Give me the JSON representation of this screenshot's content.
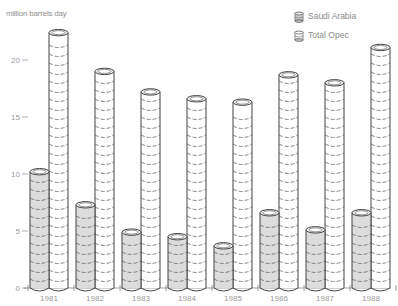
{
  "chart_data": {
    "type": "bar",
    "title": "",
    "ylabel": "million barrels day",
    "xlabel": "",
    "categories": [
      "1981",
      "1982",
      "1983",
      "1984",
      "1985",
      "1986",
      "1987",
      "1988"
    ],
    "series": [
      {
        "name": "Saudi Arabia",
        "values": [
          10.2,
          7.3,
          4.9,
          4.5,
          3.7,
          6.6,
          5.1,
          6.6
        ],
        "color": "#dcdcdc"
      },
      {
        "name": "Total Opec",
        "values": [
          22.4,
          19.0,
          17.2,
          16.6,
          16.3,
          18.7,
          18.0,
          21.1
        ],
        "color": "#ffffff"
      }
    ],
    "yticks": [
      0,
      5,
      10,
      15,
      20
    ],
    "ylim": [
      0,
      23
    ],
    "grid": false,
    "legend_position": "top-right",
    "style": "3d cylinders (stacked barrel segments)"
  },
  "legend": {
    "items": [
      {
        "label": "Saudi Arabia",
        "icon": "shaded-cylinder-icon"
      },
      {
        "label": "Total Opec",
        "icon": "white-cylinder-icon"
      }
    ]
  }
}
